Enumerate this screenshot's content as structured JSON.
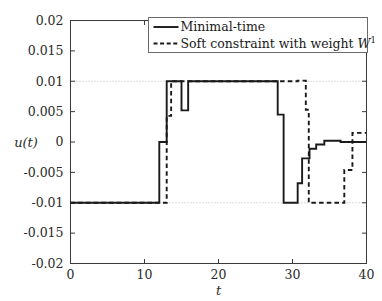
{
  "chart_data": {
    "type": "line",
    "title": "",
    "xlabel": "t",
    "ylabel": "u(t)",
    "xlim": [
      0,
      40
    ],
    "ylim": [
      -0.02,
      0.02
    ],
    "grid": "horizontal dotted gridlines at y = 0.01 and y = -0.01",
    "xticks": [
      0,
      10,
      20,
      30,
      40
    ],
    "xtick_labels": [
      "0",
      "10",
      "20",
      "30",
      "40"
    ],
    "yticks": [
      0.02,
      0.015,
      0.01,
      0.005,
      0,
      -0.005,
      -0.01,
      -0.015,
      -0.02
    ],
    "ytick_labels": [
      "0.02",
      "0.015",
      "0.01",
      "0.005",
      "0",
      "-0.005",
      "-0.01",
      "-0.015",
      "-0.02"
    ],
    "legend_position": "top-right",
    "series": [
      {
        "name": "Minimal-time",
        "style": "solid",
        "color": "#1a1a1a",
        "points": [
          [
            0,
            -0.01
          ],
          [
            12.0,
            -0.01
          ],
          [
            12.0,
            0.0
          ],
          [
            13.0,
            0.0
          ],
          [
            13.0,
            0.01
          ],
          [
            15.0,
            0.01
          ],
          [
            15.0,
            0.0052
          ],
          [
            15.9,
            0.0052
          ],
          [
            15.9,
            0.01
          ],
          [
            28.0,
            0.01
          ],
          [
            28.0,
            0.0045
          ],
          [
            28.8,
            0.0045
          ],
          [
            28.8,
            -0.01
          ],
          [
            30.7,
            -0.01
          ],
          [
            30.7,
            -0.0068
          ],
          [
            31.3,
            -0.0068
          ],
          [
            31.3,
            -0.0027
          ],
          [
            32.3,
            -0.0027
          ],
          [
            32.3,
            -0.0011
          ],
          [
            33.2,
            -0.0011
          ],
          [
            33.2,
            -0.0004
          ],
          [
            34.3,
            -0.0004
          ],
          [
            34.3,
            0.0002
          ],
          [
            36.5,
            0.0002
          ],
          [
            36.5,
            0.0
          ],
          [
            40,
            0.0
          ]
        ]
      },
      {
        "name": "Soft constraint with weight W",
        "name_superscript": "1",
        "style": "dashed",
        "color": "#1a1a1a",
        "points": [
          [
            0,
            -0.01
          ],
          [
            13.0,
            -0.01
          ],
          [
            13.0,
            0.0043
          ],
          [
            13.6,
            0.0043
          ],
          [
            13.6,
            0.01
          ],
          [
            30.7,
            0.01
          ],
          [
            30.7,
            0.0101
          ],
          [
            31.8,
            0.0101
          ],
          [
            31.8,
            0.0053
          ],
          [
            32.2,
            0.0053
          ],
          [
            32.2,
            -0.01
          ],
          [
            37.0,
            -0.01
          ],
          [
            37.0,
            -0.0046
          ],
          [
            38.1,
            -0.0046
          ],
          [
            38.1,
            0.0015
          ],
          [
            40,
            0.0015
          ]
        ]
      }
    ]
  },
  "legend": {
    "entries": [
      {
        "label": "Minimal-time",
        "style": "solid"
      },
      {
        "label": "Soft constraint with weight W",
        "superscript": "1",
        "style": "dashed"
      }
    ]
  },
  "colors": {
    "series": "#1a1a1a",
    "axis": "#3a3a3a",
    "grid": "#b9b9b9",
    "background": "#ffffff"
  }
}
